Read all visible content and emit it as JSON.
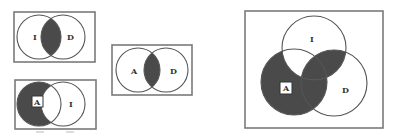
{
  "figure": {
    "colors": {
      "shade": "#4a4a4a",
      "frame": "#7a7a7a",
      "outline": "#555555",
      "background": "#ffffff"
    },
    "diagrams": [
      {
        "id": "venn-I-D",
        "sets": [
          "I",
          "D"
        ],
        "shaded_regions": [
          "I∩D"
        ]
      },
      {
        "id": "venn-A-I",
        "sets": [
          "A",
          "I"
        ],
        "boxed_label": "A",
        "shaded_regions": [
          "A only (A − I)"
        ]
      },
      {
        "id": "venn-A-D",
        "sets": [
          "A",
          "D"
        ],
        "shaded_regions": [
          "A∩D"
        ]
      },
      {
        "id": "venn-I-A-D",
        "sets": [
          "I",
          "A",
          "D"
        ],
        "boxed_label": "A",
        "shaded_regions": [
          "A only",
          "A∩D (not I)",
          "I∩D (not A)",
          "A∩I∩D"
        ]
      }
    ],
    "labels": {
      "d1_left": "I",
      "d1_right": "D",
      "d2_left": "A",
      "d2_right": "I",
      "d3_left": "A",
      "d3_right": "D",
      "d4_top": "I",
      "d4_left": "A",
      "d4_right": "D"
    }
  }
}
